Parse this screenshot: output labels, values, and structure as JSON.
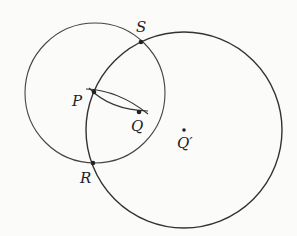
{
  "diagram": {
    "type": "geometric-construction",
    "stroke_color": "#333333",
    "background": "#fbfbfa",
    "circles": [
      {
        "name": "circle-centered-P-region",
        "cx": 95,
        "cy": 93,
        "r": 70
      },
      {
        "name": "circle-centered-Q-prime",
        "cx": 184,
        "cy": 130,
        "r": 98
      }
    ],
    "points": [
      {
        "id": "S",
        "label": "S",
        "x": 141,
        "y": 42,
        "lx": 136,
        "ly": 32
      },
      {
        "id": "P",
        "label": "P",
        "x": 94,
        "y": 92,
        "lx": 72,
        "ly": 106
      },
      {
        "id": "Q",
        "label": "Q",
        "x": 139,
        "y": 112,
        "lx": 131,
        "ly": 130
      },
      {
        "id": "R",
        "label": "R",
        "x": 93,
        "y": 163,
        "lx": 80,
        "ly": 182
      },
      {
        "id": "Qp",
        "label": "Q′",
        "x": 184,
        "y": 130,
        "lx": 177,
        "ly": 147
      }
    ]
  }
}
